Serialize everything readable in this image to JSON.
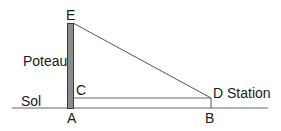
{
  "diagram": {
    "labels": {
      "E": "E",
      "post": "Poteau",
      "C": "C",
      "ground": "Sol",
      "A": "A",
      "D": "D Station",
      "B": "B"
    },
    "colors": {
      "post_fill": "#8c8c8c",
      "post_stroke": "#3a3a3a",
      "line": "#555555",
      "text": "#1a1a1a"
    }
  }
}
